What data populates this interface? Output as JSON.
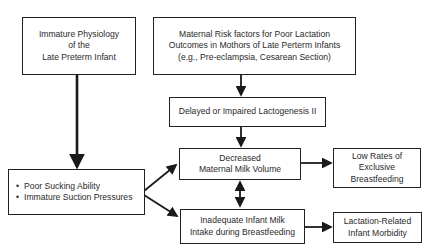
{
  "diagram": {
    "nodes": {
      "immature_physiology": {
        "lines": [
          "Immature Physiology",
          "of the",
          "Late Preterm Infant"
        ]
      },
      "maternal_risk": {
        "lines": [
          "Maternal Risk factors for Poor Lactation",
          "Outcomes in Mothors of Late Perterm Infants",
          "(e.g., Pre-eclampsia, Cesarean Section)"
        ]
      },
      "lactogenesis": {
        "lines": [
          "Delayed or Impaired Lactogenesis II"
        ]
      },
      "sucking": {
        "bullets": [
          "Poor Sucking Ability",
          "Immature Suction Pressures"
        ]
      },
      "milk_volume": {
        "lines": [
          "Decreased",
          "Maternal Milk Volume"
        ]
      },
      "low_rates": {
        "lines": [
          "Low Rates of",
          "Exclusive",
          "Breastfeeding"
        ]
      },
      "inadequate_intake": {
        "lines": [
          "Inadequate Infant Milk",
          "Intake during Breastfeeding"
        ]
      },
      "morbidity": {
        "lines": [
          "Lactation-Related",
          "Infant Morbidity"
        ]
      }
    },
    "edges": [
      {
        "from": "immature_physiology",
        "to": "sucking"
      },
      {
        "from": "maternal_risk",
        "to": "lactogenesis"
      },
      {
        "from": "lactogenesis",
        "to": "milk_volume"
      },
      {
        "from": "sucking",
        "to": "milk_volume"
      },
      {
        "from": "sucking",
        "to": "inadequate_intake"
      },
      {
        "from": "milk_volume",
        "to": "inadequate_intake",
        "bidirectional": true
      },
      {
        "from": "milk_volume",
        "to": "low_rates"
      },
      {
        "from": "inadequate_intake",
        "to": "morbidity"
      }
    ],
    "colors": {
      "stroke": "#1a1a1a",
      "background": "#ffffff",
      "text": "#2a2a2a"
    }
  }
}
